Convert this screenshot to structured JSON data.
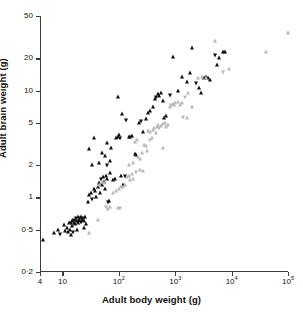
{
  "chart_data": {
    "type": "scatter",
    "title": "",
    "xlabel": "Adult body weight (g)",
    "ylabel": "Adult brain weight (g)",
    "xscale": "log",
    "yscale": "log",
    "xlim": [
      4,
      100000
    ],
    "ylim": [
      0.2,
      50
    ],
    "grid": false,
    "legend": "none",
    "xticks": [
      {
        "value": 4,
        "label": "4"
      },
      {
        "value": 10,
        "label": "10"
      },
      {
        "value": 100,
        "label": "10",
        "exp": "2"
      },
      {
        "value": 1000,
        "label": "10",
        "exp": "3"
      },
      {
        "value": 10000,
        "label": "10",
        "exp": "4"
      },
      {
        "value": 100000,
        "label": "10",
        "exp": "5"
      }
    ],
    "yticks": [
      {
        "value": 0.2,
        "label": "0·2"
      },
      {
        "value": 0.5,
        "label": "0·5"
      },
      {
        "value": 1,
        "label": "1"
      },
      {
        "value": 2,
        "label": "2"
      },
      {
        "value": 5,
        "label": "5"
      },
      {
        "value": 10,
        "label": "10"
      },
      {
        "value": 20,
        "label": "20"
      },
      {
        "value": 50,
        "label": "50"
      }
    ],
    "series": [
      {
        "name": "filled-triangle-group",
        "marker": "filled-triangle-up",
        "color": "#111111",
        "points": [
          [
            4.6,
            0.4
          ],
          [
            7.0,
            0.46
          ],
          [
            8.2,
            0.5
          ],
          [
            9.0,
            0.44
          ],
          [
            10.5,
            0.55
          ],
          [
            11.0,
            0.48
          ],
          [
            12.0,
            0.52
          ],
          [
            12.5,
            0.47
          ],
          [
            13.0,
            0.58
          ],
          [
            13.5,
            0.5
          ],
          [
            14.0,
            0.56
          ],
          [
            14.5,
            0.6
          ],
          [
            15.0,
            0.54
          ],
          [
            15.5,
            0.62
          ],
          [
            16.0,
            0.58
          ],
          [
            16.5,
            0.61
          ],
          [
            17.0,
            0.56
          ],
          [
            17.5,
            0.63
          ],
          [
            18.0,
            0.6
          ],
          [
            18.5,
            0.58
          ],
          [
            19.0,
            0.65
          ],
          [
            19.5,
            0.62
          ],
          [
            20.0,
            0.6
          ],
          [
            20.5,
            0.64
          ],
          [
            21.0,
            0.58
          ],
          [
            21.5,
            0.66
          ],
          [
            22.0,
            0.62
          ],
          [
            23.0,
            0.64
          ],
          [
            24.0,
            0.6
          ],
          [
            25.0,
            0.66
          ],
          [
            14.0,
            0.44
          ],
          [
            15.5,
            0.46
          ],
          [
            18.0,
            0.5
          ],
          [
            24.0,
            0.52
          ],
          [
            26.0,
            0.56
          ],
          [
            28.0,
            0.9
          ],
          [
            30.0,
            1.05
          ],
          [
            32.0,
            1.1
          ],
          [
            34.0,
            0.95
          ],
          [
            36.0,
            1.2
          ],
          [
            38.0,
            1.15
          ],
          [
            40.0,
            1.0
          ],
          [
            42.0,
            1.25
          ],
          [
            44.0,
            1.35
          ],
          [
            46.0,
            1.1
          ],
          [
            48.0,
            1.45
          ],
          [
            50.0,
            1.3
          ],
          [
            52.0,
            1.55
          ],
          [
            55.0,
            1.4
          ],
          [
            58.0,
            1.2
          ],
          [
            60.0,
            1.6
          ],
          [
            62.0,
            1.5
          ],
          [
            65.0,
            0.88
          ],
          [
            68.0,
            0.92
          ],
          [
            70.0,
            1.7
          ],
          [
            33.0,
            2.0
          ],
          [
            45.0,
            2.1
          ],
          [
            50.0,
            2.6
          ],
          [
            58.0,
            2.45
          ],
          [
            62.0,
            1.95
          ],
          [
            70.0,
            2.2
          ],
          [
            78.0,
            1.45
          ],
          [
            85.0,
            1.5
          ],
          [
            90.0,
            3.6
          ],
          [
            95.0,
            3.7
          ],
          [
            100.0,
            3.8
          ],
          [
            105.0,
            3.55
          ],
          [
            62.0,
            3.2
          ],
          [
            72.0,
            2.9
          ],
          [
            36.0,
            3.6
          ],
          [
            30.0,
            2.85
          ],
          [
            110.0,
            1.6
          ],
          [
            120.0,
            1.3
          ],
          [
            130.0,
            1.55
          ],
          [
            150.0,
            3.7
          ],
          [
            160.0,
            3.65
          ],
          [
            170.0,
            3.75
          ],
          [
            190.0,
            2.55
          ],
          [
            200.0,
            2.5
          ],
          [
            230.0,
            5.0
          ],
          [
            250.0,
            5.1
          ],
          [
            270.0,
            4.1
          ],
          [
            300.0,
            5.4
          ],
          [
            330.0,
            6.2
          ],
          [
            360.0,
            6.4
          ],
          [
            400.0,
            7.0
          ],
          [
            430.0,
            8.3
          ],
          [
            460.0,
            8.6
          ],
          [
            500.0,
            9.2
          ],
          [
            520.0,
            9.0
          ],
          [
            560.0,
            9.5
          ],
          [
            600.0,
            8.0
          ],
          [
            640.0,
            5.5
          ],
          [
            700.0,
            5.8
          ],
          [
            800.0,
            9.0
          ],
          [
            900.0,
            20.5
          ],
          [
            1100.0,
            10.0
          ],
          [
            1300.0,
            13.5
          ],
          [
            1600.0,
            12.0
          ],
          [
            1800.0,
            14.5
          ],
          [
            2000.0,
            25.0
          ],
          [
            2300.0,
            11.5
          ],
          [
            2600.0,
            10.5
          ],
          [
            2900.0,
            9.5
          ],
          [
            3200.0,
            13.0
          ],
          [
            3500.0,
            13.5
          ],
          [
            3800.0,
            13.0
          ],
          [
            4200.0,
            12.5
          ],
          [
            5000.0,
            21.0
          ],
          [
            5500.0,
            17.5
          ],
          [
            6000.0,
            20.0
          ],
          [
            7000.0,
            23.0
          ],
          [
            7500.0,
            23.0
          ],
          [
            95.0,
            8.8
          ],
          [
            115.0,
            6.0
          ],
          [
            135.0,
            5.2
          ]
        ]
      },
      {
        "name": "open-triangle-group",
        "marker": "open-triangle",
        "color": "#b9b9b9",
        "points": [
          [
            30.0,
            0.46
          ],
          [
            42.0,
            0.62
          ],
          [
            60.0,
            0.8
          ],
          [
            65.0,
            0.78
          ],
          [
            70.0,
            0.82
          ],
          [
            80.0,
            1.1
          ],
          [
            90.0,
            1.15
          ],
          [
            100.0,
            1.2
          ],
          [
            110.0,
            1.25
          ],
          [
            120.0,
            1.22
          ],
          [
            130.0,
            1.3
          ],
          [
            140.0,
            1.55
          ],
          [
            150.0,
            1.6
          ],
          [
            160.0,
            1.45
          ],
          [
            170.0,
            1.65
          ],
          [
            180.0,
            1.5
          ],
          [
            200.0,
            1.7
          ],
          [
            220.0,
            2.4
          ],
          [
            240.0,
            2.3
          ],
          [
            260.0,
            2.6
          ],
          [
            280.0,
            3.1
          ],
          [
            300.0,
            3.0
          ],
          [
            320.0,
            2.7
          ],
          [
            350.0,
            3.4
          ],
          [
            380.0,
            3.6
          ],
          [
            400.0,
            4.3
          ],
          [
            420.0,
            4.5
          ],
          [
            450.0,
            4.0
          ],
          [
            480.0,
            4.6
          ],
          [
            500.0,
            4.8
          ],
          [
            520.0,
            4.4
          ],
          [
            560.0,
            4.7
          ],
          [
            600.0,
            4.9
          ],
          [
            650.0,
            5.0
          ],
          [
            700.0,
            4.6
          ],
          [
            750.0,
            4.8
          ],
          [
            800.0,
            7.0
          ],
          [
            850.0,
            7.2
          ],
          [
            900.0,
            7.5
          ],
          [
            950.0,
            7.3
          ],
          [
            1000.0,
            7.6
          ],
          [
            1100.0,
            7.8
          ],
          [
            1200.0,
            7.4
          ],
          [
            1300.0,
            7.6
          ],
          [
            1500.0,
            8.5
          ],
          [
            1700.0,
            9.5
          ],
          [
            2000.0,
            7.0
          ],
          [
            2500.0,
            13.0
          ],
          [
            3000.0,
            13.5
          ],
          [
            3500.0,
            13.0
          ],
          [
            5000.0,
            29.0
          ],
          [
            7000.0,
            14.5
          ],
          [
            9000.0,
            16.0
          ],
          [
            40000.0,
            23.0
          ],
          [
            100000.0,
            35.0
          ],
          [
            240.0,
            1.8
          ],
          [
            270.0,
            1.75
          ],
          [
            95.0,
            0.8
          ],
          [
            105.0,
            0.78
          ],
          [
            150.0,
            2.0
          ],
          [
            175.0,
            2.1
          ],
          [
            190.0,
            3.3
          ],
          [
            210.0,
            3.45
          ],
          [
            330.0,
            4.2
          ],
          [
            360.0,
            4.1
          ],
          [
            1400.0,
            5.5
          ],
          [
            1600.0,
            5.6
          ],
          [
            600.0,
            2.9
          ],
          [
            55.0,
            1.35
          ],
          [
            50.0,
            1.4
          ],
          [
            45.0,
            1.3
          ]
        ]
      }
    ]
  }
}
